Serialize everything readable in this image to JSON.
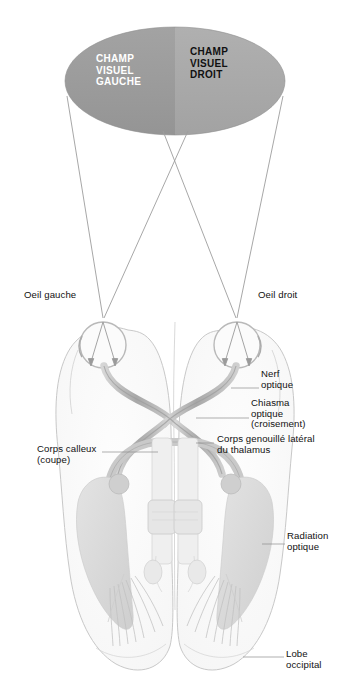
{
  "figure": {
    "language": "fr"
  },
  "visual_field": {
    "left": {
      "lines": [
        "CHAMP",
        "VISUEL",
        "GAUCHE"
      ],
      "text": "CHAMP\nVISUEL\nGAUCHE",
      "fill": "#9a9a9a",
      "text_color": "#ffffff"
    },
    "right": {
      "lines": [
        "CHAMP",
        "VISUEL",
        "DROIT"
      ],
      "text": "CHAMP\nVISUEL\nDROIT",
      "fill": "#a9a9a9",
      "text_color": "#111111"
    }
  },
  "labels": {
    "eye_left": "Oeil gauche",
    "eye_right": "Oeil droit",
    "optic_nerve": "Nerf\noptique",
    "optic_chiasm": "Chiasma\noptique\n(croisement)",
    "lgn": "Corps genouillé latéral\ndu thalamus",
    "corpus_callosum": "Corps calleux\n(coupe)",
    "optic_radiation": "Radiation\noptique",
    "occipital_lobe": "Lobe\noccipital"
  },
  "colors": {
    "field_left": "#9a9a9a",
    "field_right": "#a9a9a9",
    "ray": "#9d9d9d",
    "nerve": "#b9b9b9",
    "nerve_dark": "#9e9e9e",
    "ventricle": "#dcdcdc",
    "brain_outline": "#c9c9c9",
    "leader": "#8d8d8d",
    "text": "#111111"
  }
}
